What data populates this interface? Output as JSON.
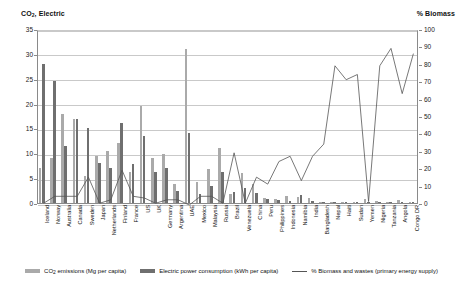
{
  "titles": {
    "left_axis": "CO2, Electric",
    "left_axis_main": "CO",
    "left_axis_sub": "2",
    "left_axis_rest": ", Electric",
    "right_axis": "% Biomass"
  },
  "legend": {
    "items": [
      {
        "label": "CO2 emissions (Mg per capita)",
        "main": "CO",
        "sub": "2",
        "rest": " emissions (Mg per capita)",
        "color": "#aaaaaa",
        "kind": "swatch",
        "icon": "legend-swatch-co2"
      },
      {
        "label": "Electric power consumption (kWh per capita)",
        "main": "Electric power consumption (kWh per capita)",
        "sub": "",
        "rest": "",
        "color": "#6f6f6f",
        "kind": "swatch",
        "icon": "legend-swatch-electric"
      },
      {
        "label": "% Biomass and wastes (primary energy supply)",
        "main": "% Biomass and wastes (primary energy supply)",
        "sub": "",
        "rest": "",
        "color": "#555555",
        "kind": "line",
        "icon": "legend-line-biomass"
      }
    ]
  },
  "chart_data": {
    "type": "bar",
    "title": "",
    "xlabel": "",
    "ylabel": "CO2, Electric",
    "y2label": "% Biomass",
    "ylim": [
      0,
      35
    ],
    "y2lim": [
      0,
      100
    ],
    "yticks": [
      0,
      5,
      10,
      15,
      20,
      25,
      30,
      35
    ],
    "y2ticks": [
      0,
      10,
      20,
      30,
      40,
      50,
      60,
      70,
      80,
      90,
      100
    ],
    "grid": true,
    "legend_position": "bottom",
    "categories": [
      "Iceland",
      "Norway",
      "Australia",
      "Canada",
      "Sweden",
      "Japan",
      "Netherlands",
      "Finland",
      "France",
      "US",
      "UK",
      "Germany",
      "Argentina",
      "UAE",
      "Mexico",
      "Malaysia",
      "Russia",
      "Brazil",
      "Venezuela",
      "China",
      "Peru",
      "Philippines",
      "Indonesia",
      "Namibia",
      "India",
      "Bangladesh",
      "Nepal",
      "Haiti",
      "Sudan",
      "Yemen",
      "Nigeria",
      "Tanzania",
      "Angola",
      "Congo DR"
    ],
    "series": [
      {
        "name": "CO2 emissions (Mg per capita)",
        "axis": "left",
        "color": "#aaaaaa",
        "values": [
          7.0,
          9.0,
          18.0,
          17.0,
          5.5,
          9.5,
          10.5,
          12.0,
          6.2,
          19.5,
          9.0,
          9.8,
          3.8,
          31.0,
          4.2,
          6.8,
          11.0,
          1.9,
          6.0,
          3.9,
          1.1,
          0.9,
          1.5,
          1.2,
          1.1,
          0.25,
          0.1,
          0.2,
          0.3,
          0.9,
          0.4,
          0.15,
          0.6,
          0.05
        ]
      },
      {
        "name": "Electric power consumption (kWh per capita)",
        "axis": "left",
        "color": "#6f6f6f",
        "values": [
          28.0,
          24.5,
          11.5,
          17.0,
          15.0,
          8.0,
          7.0,
          16.0,
          7.8,
          13.5,
          6.3,
          7.1,
          2.5,
          14.0,
          1.9,
          3.5,
          6.2,
          2.2,
          3.0,
          2.0,
          0.9,
          0.6,
          0.5,
          1.6,
          0.5,
          0.15,
          0.08,
          0.04,
          0.08,
          0.18,
          0.12,
          0.06,
          0.16,
          0.1
        ]
      },
      {
        "name": "% Biomass and wastes (primary energy supply)",
        "axis": "right",
        "color": "#555555",
        "values": [
          1,
          5,
          5,
          5,
          16,
          1,
          3,
          20,
          5,
          4,
          1,
          3,
          3,
          0,
          5,
          5,
          1,
          30,
          1,
          16,
          12,
          25,
          28,
          14,
          28,
          35,
          80,
          72,
          75,
          2,
          80,
          90,
          64,
          87
        ]
      }
    ]
  }
}
